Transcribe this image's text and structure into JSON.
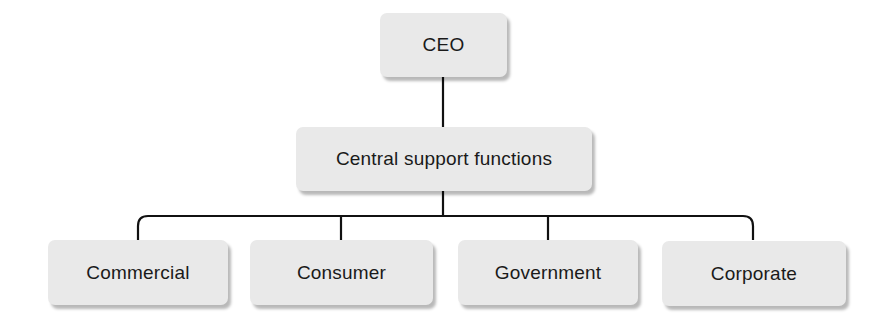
{
  "diagram": {
    "type": "org-chart",
    "root": {
      "label": "CEO",
      "children": [
        {
          "label": "Central support functions",
          "children": [
            {
              "label": "Commercial"
            },
            {
              "label": "Consumer"
            },
            {
              "label": "Government"
            },
            {
              "label": "Corporate"
            }
          ]
        }
      ]
    },
    "nodes": {
      "ceo": "CEO",
      "central": "Central support functions",
      "divisions": [
        "Commercial",
        "Consumer",
        "Government",
        "Corporate"
      ]
    },
    "colors": {
      "box_fill": "#e9e9e9",
      "line": "#111111",
      "text": "#1a1a1a"
    }
  }
}
